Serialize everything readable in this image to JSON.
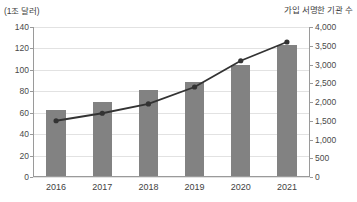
{
  "chart_data": {
    "type": "bar",
    "title": "",
    "categories": [
      "2016",
      "2017",
      "2018",
      "2019",
      "2020",
      "2021"
    ],
    "xlabel": "",
    "left_axis": {
      "label": "(1조 달러)",
      "ylim": [
        0,
        140
      ],
      "tick_step": 20,
      "ticks": [
        "0",
        "20",
        "40",
        "60",
        "80",
        "100",
        "120",
        "140"
      ],
      "tick_values": [
        0,
        20,
        40,
        60,
        80,
        100,
        120,
        140
      ]
    },
    "right_axis": {
      "label": "가입 서명한 기관 수",
      "ylim": [
        0,
        4000
      ],
      "tick_step": 500,
      "ticks": [
        "0",
        "500",
        "1,000",
        "1,500",
        "2,000",
        "2,500",
        "3,000",
        "3,500",
        "4,000"
      ],
      "tick_values": [
        0,
        500,
        1000,
        1500,
        2000,
        2500,
        3000,
        3500,
        4000
      ]
    },
    "series": [
      {
        "name": "(1조 달러)",
        "type": "bar",
        "axis": "left",
        "color": "#828282",
        "values": [
          62,
          69,
          80,
          88,
          104,
          122
        ]
      },
      {
        "name": "가입 서명한 기관 수",
        "type": "line",
        "axis": "right",
        "color": "#333333",
        "marker": "circle",
        "values": [
          1500,
          1700,
          1950,
          2400,
          3100,
          3600
        ]
      }
    ],
    "grid": true,
    "legend": "none"
  }
}
